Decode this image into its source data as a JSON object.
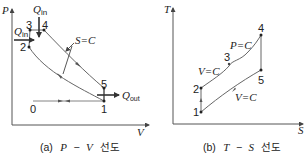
{
  "diagram_pv": {
    "caption_prefix": "(a)",
    "caption_x": "P",
    "caption_dash": "−",
    "caption_y": "V",
    "caption_suffix": "선도",
    "axis_y_label": "P",
    "axis_x_label": "V",
    "points": [
      {
        "id": "0",
        "label": "0"
      },
      {
        "id": "1",
        "label": "1"
      },
      {
        "id": "2",
        "label": "2"
      },
      {
        "id": "3",
        "label": "3"
      },
      {
        "id": "4",
        "label": "4"
      },
      {
        "id": "5",
        "label": "5"
      }
    ],
    "q_in_top": {
      "base": "Q",
      "sub": "in"
    },
    "q_in_left": {
      "base": "Q",
      "sub": "in"
    },
    "q_out": {
      "base": "Q",
      "sub": "out"
    },
    "isentropic_label": "S=C"
  },
  "diagram_ts": {
    "caption_prefix": "(b)",
    "caption_x": "T",
    "caption_dash": "−",
    "caption_y": "S",
    "caption_suffix": "선도",
    "axis_y_label": "T",
    "axis_x_label": "S",
    "points": [
      {
        "id": "1",
        "label": "1"
      },
      {
        "id": "2",
        "label": "2"
      },
      {
        "id": "3",
        "label": "3"
      },
      {
        "id": "4",
        "label": "4"
      },
      {
        "id": "5",
        "label": "5"
      }
    ],
    "label_const_pressure": "P=C",
    "label_const_volume_top": "V=C",
    "label_const_volume_bottom": "V=C"
  },
  "colors": {
    "line": "#4a4a4a",
    "text": "#222222",
    "background": "#ffffff"
  }
}
